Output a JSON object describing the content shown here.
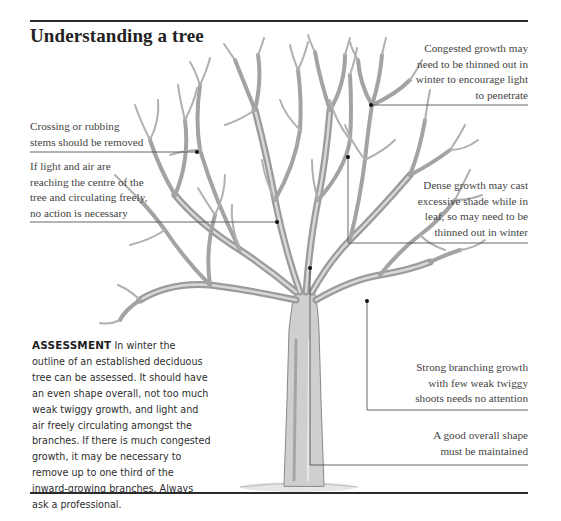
{
  "page": {
    "title": "Understanding a tree",
    "colors": {
      "rule": "#2a2a2a",
      "text": "#444444",
      "branch": "#9a9a9a",
      "leader": "#555555"
    }
  },
  "callouts": {
    "congested": {
      "lines": [
        "Congested growth may",
        "need to be thinned out in",
        "winter to encourage light",
        "to penetrate"
      ]
    },
    "crossing": {
      "lines": [
        "Crossing or rubbing",
        "stems should be removed"
      ]
    },
    "light_air": {
      "lines": [
        "If light and air are",
        "reaching the centre of the",
        "tree and circulating freely,",
        "no action is necessary"
      ]
    },
    "dense": {
      "lines": [
        "Dense growth may cast",
        "excessive shade while in",
        "leaf, so may need to be",
        "thinned out in winter"
      ]
    },
    "strong": {
      "lines": [
        "Strong branching growth",
        "with few weak twiggy",
        "shoots needs no attention"
      ]
    },
    "shape": {
      "lines": [
        "A good overall shape",
        "must be maintained"
      ]
    }
  },
  "assessment": {
    "heading": "ASSESSMENT",
    "lines": [
      " In winter the",
      "outline of an established deciduous",
      "tree can be assessed. It should have",
      "an even shape overall, not too much",
      "weak twiggy growth, and light and",
      "air freely circulating amongst the",
      "branches. If there is much congested",
      "growth, it may be necessary to",
      "remove up to one third of the",
      "inward-growing branches. Always",
      "ask a professional."
    ]
  },
  "illustration": {
    "subject": "deciduous-tree-winter-icon"
  }
}
